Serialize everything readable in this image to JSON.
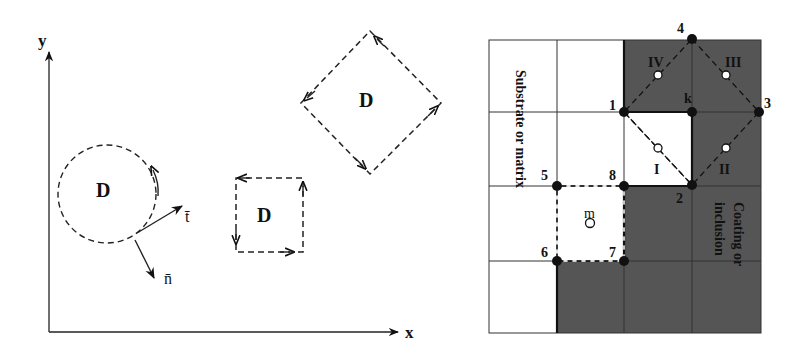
{
  "left_figure": {
    "axes": {
      "x_label": "x",
      "y_label": "y"
    },
    "domains": [
      {
        "shape": "circle",
        "label": "D"
      },
      {
        "shape": "square",
        "label": "D"
      },
      {
        "shape": "diamond",
        "label": "D"
      }
    ],
    "vectors": {
      "tangent": "t̄",
      "normal": "n̄"
    }
  },
  "right_figure": {
    "region_labels": {
      "substrate": "Substrate or matrix",
      "coating_line1": "Coating or",
      "coating_line2": "inclusion"
    },
    "nodes": {
      "n1": "1",
      "n2": "2",
      "n3": "3",
      "n4": "4",
      "nk": "k",
      "n5": "5",
      "n6": "6",
      "n7": "7",
      "n8": "8"
    },
    "cells": {
      "c1": "I",
      "c2": "II",
      "c3": "III",
      "c4": "IV",
      "cm": "m"
    },
    "colors": {
      "shaded": "#555555",
      "grid": "#333333",
      "background": "#ffffff"
    }
  }
}
